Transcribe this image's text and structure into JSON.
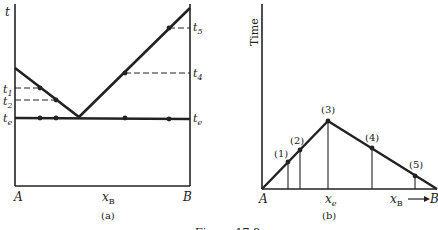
{
  "panel_a": {
    "y_axis_label": "t",
    "left_end_label": "A",
    "right_end_label": "B",
    "x_axis_label": "x",
    "x_axis_subscript": "B",
    "caption": "(a)",
    "levels": [
      {
        "name": "t1",
        "base": "t",
        "sub": "1",
        "side": "left"
      },
      {
        "name": "t2",
        "base": "t",
        "sub": "2",
        "side": "left"
      },
      {
        "name": "te_left",
        "base": "t",
        "sub": "e",
        "side": "left"
      },
      {
        "name": "t5",
        "base": "t",
        "sub": "5",
        "side": "right"
      },
      {
        "name": "t4",
        "base": "t",
        "sub": "4",
        "side": "right"
      },
      {
        "name": "te_right",
        "base": "t",
        "sub": "e",
        "side": "right"
      }
    ]
  },
  "panel_b": {
    "y_axis_label": "Time",
    "left_end_label": "A",
    "right_end_label": "B",
    "eutectic_label": "x",
    "eutectic_subscript": "e",
    "x_axis_label": "x",
    "x_axis_subscript": "B",
    "caption": "(b)",
    "points": [
      {
        "label": "(1)"
      },
      {
        "label": "(2)"
      },
      {
        "label": "(3)"
      },
      {
        "label": "(4)"
      },
      {
        "label": "(5)"
      }
    ]
  },
  "figure_caption": "Figure 17.8",
  "colors": {
    "ink": "#222222",
    "background": "#ffffff"
  }
}
